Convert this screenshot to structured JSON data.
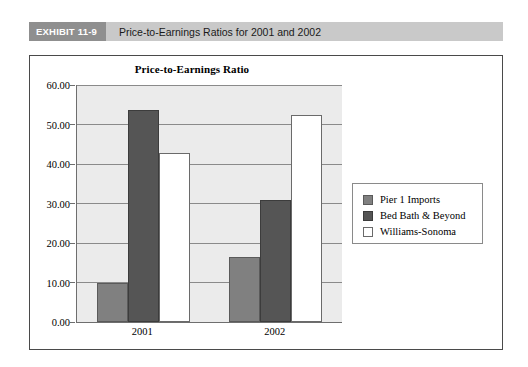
{
  "exhibit": {
    "tag": "EXHIBIT 11-9",
    "title": "Price-to-Earnings Ratios for 2001 and 2002"
  },
  "chart_data": {
    "type": "bar",
    "title": "Price-to-Earnings Ratio",
    "xlabel": "",
    "ylabel": "",
    "categories": [
      "2001",
      "2002"
    ],
    "series": [
      {
        "name": "Pier 1 Imports",
        "values": [
          10.0,
          16.5
        ],
        "color": "#808080"
      },
      {
        "name": "Bed Bath & Beyond",
        "values": [
          53.7,
          31.0
        ],
        "color": "#555555"
      },
      {
        "name": "Williams-Sonoma",
        "values": [
          42.8,
          52.3
        ],
        "color": "#ffffff"
      }
    ],
    "ylim": [
      0,
      60
    ],
    "ytick_step": 10,
    "ytick_labels": [
      "0.00",
      "10.00",
      "20.00",
      "30.00",
      "40.00",
      "50.00",
      "60.00"
    ],
    "grid": true,
    "legend_position": "right",
    "plot_background": "#ebebeb",
    "gridline_color": "#8a8a8a"
  }
}
